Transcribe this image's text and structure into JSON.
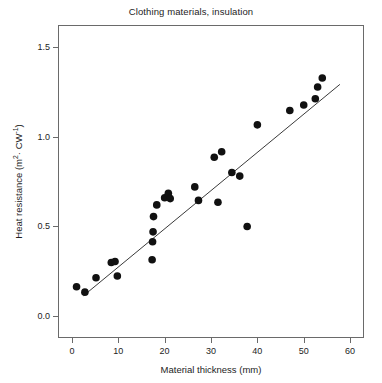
{
  "chart_data": {
    "type": "scatter",
    "title": "Clothing materials, insulation",
    "xlabel": "Material thickness (mm)",
    "ylabel": "Heat resistance (m²· CW⁻¹)",
    "ylabel_parts": {
      "prefix": "Heat resistance (m",
      "sup1": "2",
      "mid": "· CW",
      "sup2": "-1",
      "suffix": ")"
    },
    "xlim": [
      -3,
      63
    ],
    "ylim": [
      -0.12,
      1.62
    ],
    "xticks": [
      0,
      10,
      20,
      30,
      40,
      50,
      60
    ],
    "xtick_labels": [
      "0",
      "10",
      "20",
      "30",
      "40",
      "50",
      "60"
    ],
    "yticks": [
      0.0,
      0.5,
      1.0,
      1.5
    ],
    "ytick_labels": [
      "0.0",
      "0.5",
      "1.0",
      "1.5"
    ],
    "grid": false,
    "legend": null,
    "marker": {
      "shape": "circle",
      "color": "#111111",
      "size_px": 7.6
    },
    "fit_line": {
      "label": "least-squares regression line",
      "color": "#3a3a3a",
      "width_px": 1,
      "x_start": 2.5,
      "y_start": 0.115,
      "x_end": 57.8,
      "y_end": 1.29
    },
    "points": [
      {
        "x": 1.0,
        "y": 0.165
      },
      {
        "x": 2.8,
        "y": 0.135
      },
      {
        "x": 5.2,
        "y": 0.215
      },
      {
        "x": 8.5,
        "y": 0.3
      },
      {
        "x": 9.3,
        "y": 0.305
      },
      {
        "x": 9.8,
        "y": 0.225
      },
      {
        "x": 17.3,
        "y": 0.315
      },
      {
        "x": 17.4,
        "y": 0.415
      },
      {
        "x": 17.5,
        "y": 0.47
      },
      {
        "x": 17.6,
        "y": 0.555
      },
      {
        "x": 18.3,
        "y": 0.62
      },
      {
        "x": 20.0,
        "y": 0.66
      },
      {
        "x": 20.8,
        "y": 0.685
      },
      {
        "x": 21.2,
        "y": 0.655
      },
      {
        "x": 26.5,
        "y": 0.72
      },
      {
        "x": 27.3,
        "y": 0.645
      },
      {
        "x": 30.7,
        "y": 0.885
      },
      {
        "x": 32.3,
        "y": 0.915
      },
      {
        "x": 31.5,
        "y": 0.635
      },
      {
        "x": 34.5,
        "y": 0.8
      },
      {
        "x": 36.2,
        "y": 0.78
      },
      {
        "x": 37.8,
        "y": 0.5
      },
      {
        "x": 40.0,
        "y": 1.065
      },
      {
        "x": 47.0,
        "y": 1.145
      },
      {
        "x": 50.0,
        "y": 1.175
      },
      {
        "x": 52.5,
        "y": 1.21
      },
      {
        "x": 53.0,
        "y": 1.275
      },
      {
        "x": 54.0,
        "y": 1.325
      }
    ]
  }
}
